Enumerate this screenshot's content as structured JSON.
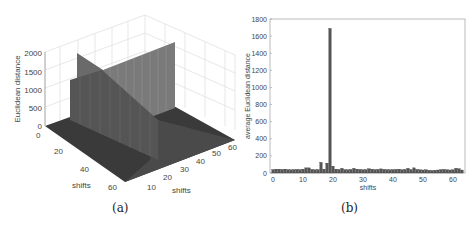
{
  "captions": {
    "a": "(a)",
    "b": "(b)"
  },
  "chart_data": [
    {
      "type": "surface3d",
      "panel": "(a)",
      "title": "",
      "xlabel": "shifts",
      "ylabel": "shifts",
      "zlabel": "Euclidean distance",
      "x_ticks": [
        "10",
        "20",
        "30",
        "40",
        "50",
        "60"
      ],
      "y_ticks": [
        "0",
        "20",
        "40",
        "60"
      ],
      "z_ticks": [
        "0",
        "500",
        "1000",
        "1500",
        "2000"
      ],
      "zlim": [
        0,
        2000
      ],
      "grid": true,
      "description": "64x64 surface of Euclidean distance; low noise floor with two perpendicular wall ridges of height ~1600-1800 at shift index ~19 along each axis"
    },
    {
      "type": "bar",
      "panel": "(b)",
      "title": "",
      "xlabel": "shifts",
      "ylabel": "average Euclidean distance",
      "x_ticks": [
        "0",
        "10",
        "20",
        "30",
        "40",
        "50",
        "60"
      ],
      "y_ticks": [
        "0",
        "200",
        "400",
        "600",
        "800",
        "1000",
        "1200",
        "1400",
        "1600",
        "1800"
      ],
      "xlim": [
        -1,
        64
      ],
      "ylim": [
        0,
        1800
      ],
      "grid": false,
      "categories": [
        0,
        1,
        2,
        3,
        4,
        5,
        6,
        7,
        8,
        9,
        10,
        11,
        12,
        13,
        14,
        15,
        16,
        17,
        18,
        19,
        20,
        21,
        22,
        23,
        24,
        25,
        26,
        27,
        28,
        29,
        30,
        31,
        32,
        33,
        34,
        35,
        36,
        37,
        38,
        39,
        40,
        41,
        42,
        43,
        44,
        45,
        46,
        47,
        48,
        49,
        50,
        51,
        52,
        53,
        54,
        55,
        56,
        57,
        58,
        59,
        60,
        61,
        62,
        63
      ],
      "values": [
        40,
        45,
        45,
        42,
        45,
        40,
        38,
        40,
        42,
        40,
        45,
        60,
        60,
        42,
        38,
        40,
        125,
        45,
        115,
        1690,
        80,
        45,
        42,
        55,
        40,
        38,
        42,
        55,
        45,
        42,
        38,
        40,
        50,
        45,
        40,
        42,
        48,
        42,
        40,
        38,
        40,
        42,
        45,
        38,
        42,
        55,
        40,
        60,
        42,
        38,
        35,
        38,
        32,
        30,
        32,
        35,
        40,
        42,
        38,
        35,
        38,
        55,
        50,
        35
      ]
    }
  ]
}
